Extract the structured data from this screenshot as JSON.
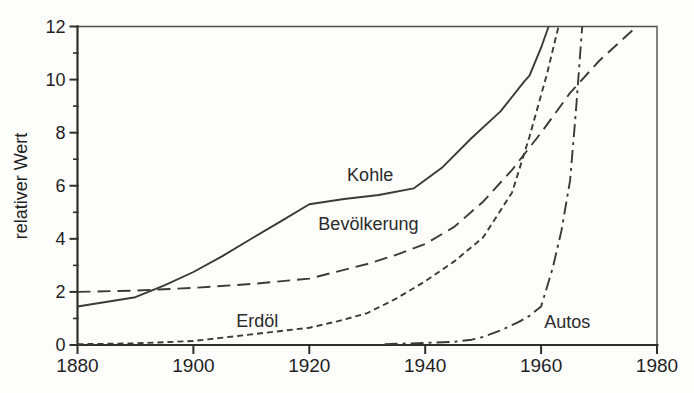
{
  "chart_data": {
    "type": "line",
    "title": "",
    "xlabel": "",
    "ylabel": "relativer Wert",
    "xlim": [
      1880,
      1980
    ],
    "ylim": [
      0,
      12
    ],
    "x_ticks": [
      1880,
      1900,
      1920,
      1940,
      1960,
      1980
    ],
    "y_ticks": [
      0,
      2,
      4,
      6,
      8,
      10,
      12
    ],
    "y_minor_ticks": [
      1,
      3,
      5,
      7,
      9,
      11
    ],
    "grid": false,
    "legend_position": "inline-labels",
    "ink_color": "#3a3a3a",
    "axis_color": "#2e2e2e",
    "border_color": "#4d4d4d",
    "series": [
      {
        "name": "Kohle",
        "line_style": "solid",
        "label_pos": [
          1930.5,
          6.4
        ],
        "points": [
          [
            1880,
            1.45
          ],
          [
            1890,
            1.8
          ],
          [
            1895,
            2.25
          ],
          [
            1900,
            2.75
          ],
          [
            1905,
            3.35
          ],
          [
            1910,
            4.0
          ],
          [
            1915,
            4.65
          ],
          [
            1920,
            5.3
          ],
          [
            1926,
            5.5
          ],
          [
            1932,
            5.65
          ],
          [
            1938,
            5.9
          ],
          [
            1943,
            6.7
          ],
          [
            1948,
            7.8
          ],
          [
            1953,
            8.8
          ],
          [
            1957,
            9.9
          ],
          [
            1958,
            10.15
          ],
          [
            1960,
            11.2
          ],
          [
            1961.3,
            12
          ]
        ]
      },
      {
        "name": "Bevölkerung",
        "line_style": "long-dash",
        "label_pos": [
          1930.2,
          4.55
        ],
        "points": [
          [
            1880,
            2.0
          ],
          [
            1890,
            2.05
          ],
          [
            1900,
            2.15
          ],
          [
            1910,
            2.3
          ],
          [
            1920,
            2.5
          ],
          [
            1930,
            3.05
          ],
          [
            1935,
            3.4
          ],
          [
            1940,
            3.8
          ],
          [
            1945,
            4.45
          ],
          [
            1950,
            5.4
          ],
          [
            1955,
            6.6
          ],
          [
            1960,
            8.0
          ],
          [
            1965,
            9.5
          ],
          [
            1970,
            10.7
          ],
          [
            1976.5,
            12
          ]
        ]
      },
      {
        "name": "Erdöl",
        "line_style": "short-dash",
        "label_pos": [
          1911,
          0.92
        ],
        "points": [
          [
            1880,
            0.03
          ],
          [
            1890,
            0.06
          ],
          [
            1900,
            0.15
          ],
          [
            1910,
            0.4
          ],
          [
            1920,
            0.65
          ],
          [
            1925,
            0.9
          ],
          [
            1930,
            1.2
          ],
          [
            1935,
            1.75
          ],
          [
            1940,
            2.4
          ],
          [
            1945,
            3.15
          ],
          [
            1950,
            4.05
          ],
          [
            1955,
            5.75
          ],
          [
            1958,
            7.85
          ],
          [
            1961,
            10.2
          ],
          [
            1963,
            12
          ]
        ]
      },
      {
        "name": "Autos",
        "line_style": "dash-dot",
        "label_pos": [
          1964.5,
          0.85
        ],
        "points": [
          [
            1933,
            0.03
          ],
          [
            1940,
            0.08
          ],
          [
            1945,
            0.12
          ],
          [
            1948,
            0.2
          ],
          [
            1950,
            0.3
          ],
          [
            1953,
            0.55
          ],
          [
            1956,
            0.85
          ],
          [
            1958,
            1.1
          ],
          [
            1960,
            1.45
          ],
          [
            1962,
            2.9
          ],
          [
            1963.5,
            4.3
          ],
          [
            1965,
            6.2
          ],
          [
            1966,
            8.8
          ],
          [
            1967.1,
            12
          ]
        ]
      }
    ]
  }
}
